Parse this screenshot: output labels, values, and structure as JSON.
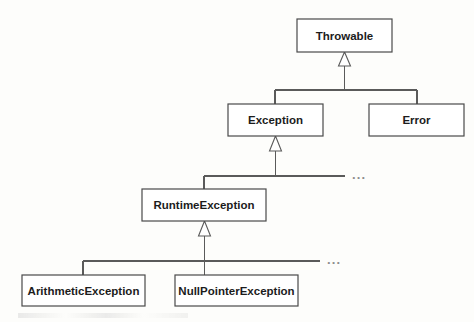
{
  "diagram": {
    "type": "uml-class-hierarchy",
    "background_color": "#fdfdfb",
    "line_color": "#5a5a5a",
    "box_fill": "#ffffff",
    "text_color": "#1c1c1c",
    "ellipsis_color": "#8d8d8d",
    "nodes": [
      {
        "id": "throwable",
        "label": "Throwable",
        "x": 297,
        "y": 19,
        "w": 95,
        "h": 33
      },
      {
        "id": "exception",
        "label": "Exception",
        "x": 228,
        "y": 104,
        "w": 95,
        "h": 32
      },
      {
        "id": "error",
        "label": "Error",
        "x": 369,
        "y": 104,
        "w": 95,
        "h": 32
      },
      {
        "id": "runtime-exception",
        "label": "RuntimeException",
        "x": 142,
        "y": 189,
        "w": 124,
        "h": 32
      },
      {
        "id": "arithmetic-exception",
        "label": "ArithmeticException",
        "x": 22,
        "y": 275,
        "w": 123,
        "h": 31
      },
      {
        "id": "nullpointer-exception",
        "label": "NullPointerException",
        "x": 175,
        "y": 275,
        "w": 123,
        "h": 31
      }
    ],
    "edges": [
      {
        "id": "edge-throwable-exception",
        "from": "exception",
        "to": "throwable",
        "relation": "extends"
      },
      {
        "id": "edge-throwable-error",
        "from": "error",
        "to": "throwable",
        "relation": "extends"
      },
      {
        "id": "edge-exception-runtime",
        "from": "runtime-exception",
        "to": "exception",
        "relation": "extends"
      },
      {
        "id": "edge-runtime-arithmetic",
        "from": "arithmetic-exception",
        "to": "runtime-exception",
        "relation": "extends"
      },
      {
        "id": "edge-runtime-nullpointer",
        "from": "nullpointer-exception",
        "to": "runtime-exception",
        "relation": "extends"
      }
    ],
    "ellipses": [
      {
        "id": "ellipsis-exception-subclasses",
        "label": "...",
        "x": 352,
        "y": 176,
        "meaning": "other Exception subclasses"
      },
      {
        "id": "ellipsis-runtime-subclasses",
        "label": "...",
        "x": 327,
        "y": 261,
        "meaning": "other RuntimeException subclasses"
      }
    ]
  }
}
